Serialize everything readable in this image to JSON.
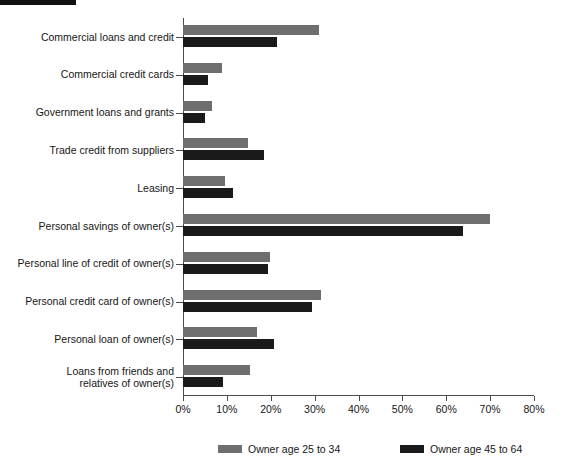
{
  "chart_data": {
    "type": "bar",
    "orientation": "horizontal",
    "title": "",
    "subtitle": "",
    "xlabel": "",
    "ylabel": "",
    "xlim": [
      0,
      80
    ],
    "xticks": [
      0,
      10,
      20,
      30,
      40,
      50,
      60,
      70,
      80
    ],
    "xticklabels": [
      "0%",
      "10%",
      "20%",
      "30%",
      "40%",
      "50%",
      "60%",
      "70%",
      "80%"
    ],
    "grid": false,
    "legend_position": "bottom",
    "categories": [
      "Commercial loans and credit",
      "Commercial credit cards",
      "Government loans and grants",
      "Trade credit from suppliers",
      "Leasing",
      "Personal savings of owner(s)",
      "Personal line of credit of owner(s)",
      "Personal credit card of owner(s)",
      "Personal loan of owner(s)",
      "Loans from friends and\nrelatives of owner(s)"
    ],
    "series": [
      {
        "name": "Owner age 25 to 34",
        "color": "#6e6e6e",
        "values": [
          31.0,
          9.0,
          6.5,
          14.8,
          9.6,
          70.0,
          19.8,
          31.5,
          16.8,
          15.3
        ]
      },
      {
        "name": "Owner age 45 to 64",
        "color": "#1a1a1a",
        "values": [
          21.4,
          5.6,
          5.0,
          18.4,
          11.5,
          63.8,
          19.4,
          29.5,
          20.8,
          9.2
        ]
      }
    ]
  },
  "legend": {
    "items": [
      {
        "label": "Owner age 25 to 34",
        "color": "#6e6e6e"
      },
      {
        "label": "Owner age 45 to 64",
        "color": "#1a1a1a"
      }
    ]
  },
  "axis": {
    "x_tick_labels": [
      "0%",
      "10%",
      "20%",
      "30%",
      "40%",
      "50%",
      "60%",
      "70%",
      "80%"
    ]
  }
}
